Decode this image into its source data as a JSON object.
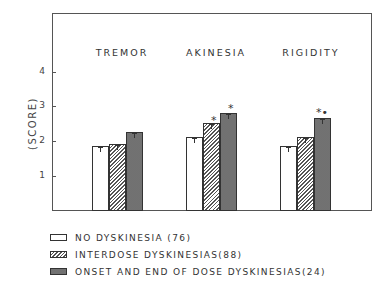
{
  "chart_data": {
    "type": "bar",
    "title": "",
    "xlabel": "",
    "ylabel": "(SCORE)",
    "ylim": [
      0,
      5
    ],
    "yticks": [
      1,
      2,
      3,
      4
    ],
    "grid": false,
    "legend_position": "bottom",
    "categories": [
      "TREMOR",
      "AKINESIA",
      "RIGIDITY"
    ],
    "series": [
      {
        "name": "NO DYSKINESIA (76)",
        "pattern": "white",
        "values": [
          1.85,
          2.1,
          1.85
        ]
      },
      {
        "name": "INTERDOSE DYSKINESIAS(88)",
        "pattern": "hatched",
        "values": [
          1.9,
          2.5,
          2.1
        ]
      },
      {
        "name": "ONSET AND END OF DOSE DYSKINESIAS(24)",
        "pattern": "dotted",
        "values": [
          2.25,
          2.8,
          2.65
        ]
      }
    ],
    "annotations": [
      {
        "category": "AKINESIA",
        "series": "INTERDOSE DYSKINESIAS(88)",
        "text": "*"
      },
      {
        "category": "AKINESIA",
        "series": "ONSET AND END OF DOSE DYSKINESIAS(24)",
        "text": "*"
      },
      {
        "category": "RIGIDITY",
        "series": "ONSET AND END OF DOSE DYSKINESIAS(24)",
        "text": "*•"
      }
    ]
  },
  "axis": {
    "ylabel": "(SCORE)",
    "ticks": [
      "1",
      "2",
      "3",
      "4"
    ]
  },
  "categories": [
    "TREMOR",
    "AKINESIA",
    "RIGIDITY"
  ],
  "legend": [
    "NO DYSKINESIA (76)",
    "INTERDOSE DYSKINESIAS(88)",
    "ONSET AND END OF DOSE DYSKINESIAS(24)"
  ],
  "stars": {
    "akinesia_interdose": "*",
    "akinesia_onset": "*",
    "rigidity_onset": "*•"
  }
}
